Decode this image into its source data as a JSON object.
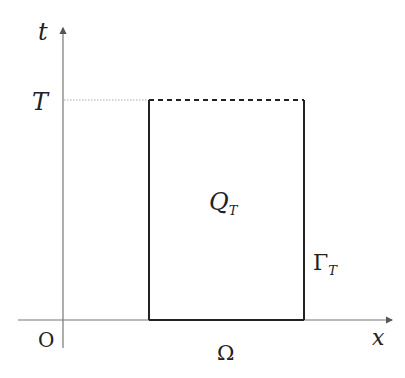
{
  "diagram": {
    "type": "space-time domain",
    "axes": {
      "vertical_label": "t",
      "horizontal_label": "x",
      "origin_label": "O"
    },
    "labels": {
      "time_marker": "T",
      "region_main": "Q",
      "region_sub": "T",
      "boundary_main": "Γ",
      "boundary_sub": "T",
      "base_label": "Ω"
    },
    "colors": {
      "axis": "#777777",
      "rectangle": "#222222",
      "dotted_guide": "#aaaaaa",
      "background": "#ffffff"
    }
  }
}
